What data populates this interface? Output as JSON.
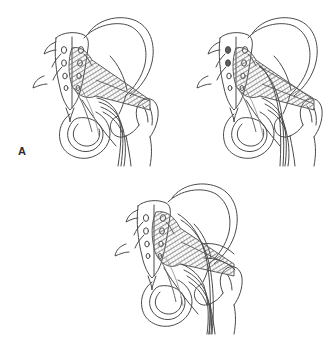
{
  "figure": {
    "background_color": "#ffffff",
    "ink_color": "#4a4a4a",
    "muscle_color": "#7a7a7a",
    "label_color": "#2b2b2b",
    "panel_count": 3
  },
  "panels": [
    {
      "id": "a",
      "label": "A",
      "description": "Undivided sciatic nerve passes below an undivided piriformis muscle",
      "structures": [
        "sacrum",
        "sacral-foramina",
        "ilium",
        "iliac-crest",
        "ischium",
        "obturator-foramen",
        "femur",
        "greater-trochanter",
        "piriformis-muscle",
        "sciatic-nerve",
        "sacrotuberous-ligament"
      ],
      "nerve_strands": 3,
      "nerve_course": "below-piriformis"
    },
    {
      "id": "b",
      "label": "B",
      "description": "Divided sciatic nerve: one division passes through the piriformis, one passes below it",
      "structures": [
        "sacrum",
        "sacral-foramina",
        "ilium",
        "iliac-crest",
        "ischium",
        "obturator-foramen",
        "femur",
        "greater-trochanter",
        "piriformis-muscle",
        "sciatic-nerve",
        "sacrotuberous-ligament"
      ],
      "nerve_strands": 4,
      "nerve_course": "through-and-below-piriformis"
    },
    {
      "id": "c",
      "label": "C",
      "description": "Divided sciatic nerve: one division passes above the piriformis, one passes below it",
      "structures": [
        "sacrum",
        "sacral-foramina",
        "ilium",
        "iliac-crest",
        "ischium",
        "obturator-foramen",
        "femur",
        "greater-trochanter",
        "piriformis-muscle",
        "sciatic-nerve",
        "sacrotuberous-ligament"
      ],
      "nerve_strands": 5,
      "nerve_course": "above-and-below-piriformis"
    }
  ]
}
